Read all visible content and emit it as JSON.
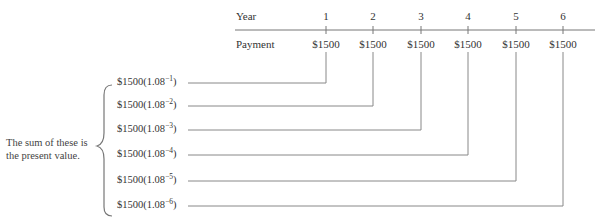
{
  "timeline": {
    "year_label": "Year",
    "payment_label": "Payment",
    "years": [
      "1",
      "2",
      "3",
      "4",
      "5",
      "6"
    ],
    "payments": [
      "$1500",
      "$1500",
      "$1500",
      "$1500",
      "$1500",
      "$1500"
    ]
  },
  "present_values": [
    {
      "base": "$1500(1.08",
      "exponent": "−1",
      "close": ")"
    },
    {
      "base": "$1500(1.08",
      "exponent": "−2",
      "close": ")"
    },
    {
      "base": "$1500(1.08",
      "exponent": "−3",
      "close": ")"
    },
    {
      "base": "$1500(1.08",
      "exponent": "−4",
      "close": ")"
    },
    {
      "base": "$1500(1.08",
      "exponent": "−5",
      "close": ")"
    },
    {
      "base": "$1500(1.08",
      "exponent": "−6",
      "close": ")"
    }
  ],
  "note": {
    "line1": "The sum of these is",
    "line2": "the present value."
  },
  "colors": {
    "line": "#888888",
    "text": "#333333"
  }
}
